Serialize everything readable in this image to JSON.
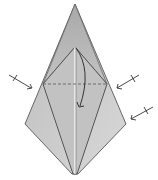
{
  "diagram": {
    "type": "origami-fold-step",
    "colors": {
      "paper_light": "#c9c9c9",
      "paper_dark": "#a9a9a9",
      "outline": "#555555",
      "arrow": "#333333"
    },
    "symbols": [
      {
        "name": "valley-fold-line",
        "style": "dashed"
      },
      {
        "name": "fold-down-arrow",
        "style": "curved"
      },
      {
        "name": "fold-arrow-left",
        "style": "arrow-with-tick"
      },
      {
        "name": "fold-arrow-right-upper",
        "style": "arrow-with-tick"
      },
      {
        "name": "fold-arrow-right-lower",
        "style": "arrow-with-tick"
      }
    ]
  }
}
